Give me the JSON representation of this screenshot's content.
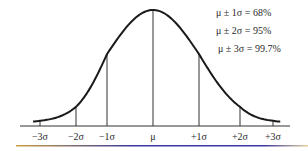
{
  "chart_data": {
    "type": "line",
    "title": "",
    "xlabel": "",
    "ylabel": "",
    "distribution": "normal",
    "mean": 0,
    "sd": 1,
    "xlim": [
      -3.6,
      3.6
    ],
    "x_ticks": [
      -3,
      -2,
      -1,
      0,
      1,
      2,
      3
    ],
    "x_tick_labels": [
      "−3σ",
      "−2σ",
      "−1σ",
      "μ",
      "+1σ",
      "+2σ",
      "+3σ"
    ],
    "vertical_lines_at": [
      -3,
      -2,
      -1,
      0,
      1,
      2,
      3
    ],
    "grid": false,
    "annotations": [
      {
        "text": "μ ± 1σ = 68%",
        "within_sd": 1,
        "percent": 68
      },
      {
        "text": "μ ± 2σ = 95%",
        "within_sd": 2,
        "percent": 95
      },
      {
        "text": "μ ± 3σ = 99.7%",
        "within_sd": 3,
        "percent": 99.7
      }
    ],
    "annotation_placement": "top-right",
    "colors": {
      "curve": "#1a1a1a",
      "lines": "#333333",
      "underline_left": "#c8a040",
      "underline_mid": "#3a3aa0",
      "underline_right": "#e8d0a0"
    }
  }
}
